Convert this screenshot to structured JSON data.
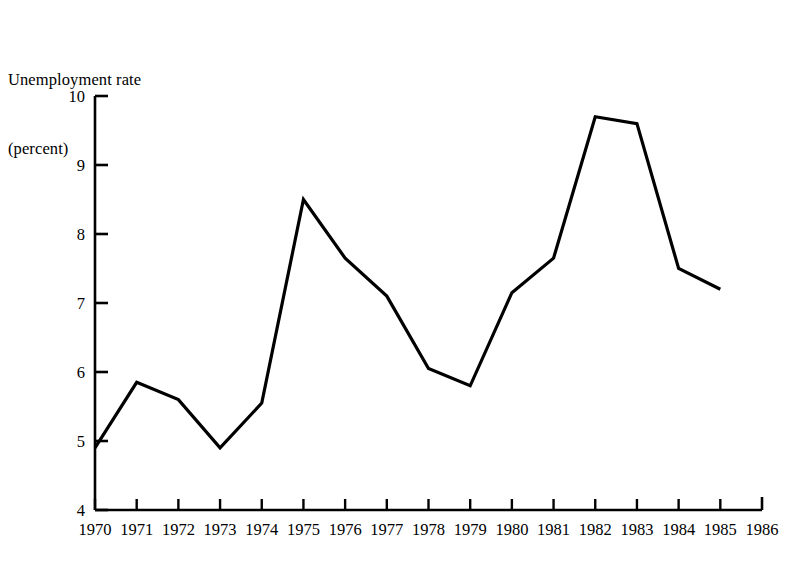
{
  "chart_data": {
    "type": "line",
    "title": "Unemployment rate (percent)",
    "title_lines": [
      "Unemployment rate",
      "(percent)"
    ],
    "xlabel": "",
    "ylabel": "Unemployment rate (percent)",
    "x": [
      1970,
      1971,
      1972,
      1973,
      1974,
      1975,
      1976,
      1977,
      1978,
      1979,
      1980,
      1981,
      1982,
      1983,
      1984,
      1985
    ],
    "values": [
      4.9,
      5.85,
      5.6,
      4.9,
      5.55,
      8.5,
      7.65,
      7.1,
      6.05,
      5.8,
      7.15,
      7.65,
      9.7,
      9.6,
      7.5,
      7.2
    ],
    "series": [
      {
        "name": "Unemployment rate",
        "values": [
          4.9,
          5.85,
          5.6,
          4.9,
          5.55,
          8.5,
          7.65,
          7.1,
          6.05,
          5.8,
          7.15,
          7.65,
          9.7,
          9.6,
          7.5,
          7.2
        ]
      }
    ],
    "xlim": [
      1970,
      1986
    ],
    "ylim": [
      4,
      10
    ],
    "ytick_labels": [
      "10",
      "9",
      "8",
      "7",
      "6",
      "5",
      "4"
    ],
    "yticks": [
      10,
      9,
      8,
      7,
      6,
      5,
      4
    ],
    "xtick_labels": [
      "1970",
      "1971",
      "1972",
      "1973",
      "1974",
      "1975",
      "1976",
      "1977",
      "1978",
      "1979",
      "1980",
      "1981",
      "1982",
      "1983",
      "1984",
      "1985",
      "1986"
    ],
    "xticks": [
      1970,
      1971,
      1972,
      1973,
      1974,
      1975,
      1976,
      1977,
      1978,
      1979,
      1980,
      1981,
      1982,
      1983,
      1984,
      1985,
      1986
    ],
    "grid": false,
    "legend": null,
    "legend_position": "none",
    "annotations": [],
    "colors": {
      "background": "#ffffff",
      "line": "#000000",
      "axis": "#000000",
      "text": "#000000"
    },
    "line_width": 3.2,
    "tick_direction": "in"
  }
}
